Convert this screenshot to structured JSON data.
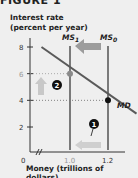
{
  "figure_title": "FIGURE 1",
  "chart_data": {
    "type": "line",
    "title": "FIGURE 1",
    "ylabel_line1": "Interest rate",
    "ylabel_line2": "(percent per year)",
    "xlabel": "Money (trillions of dollars)",
    "y_ticks": [
      2,
      4,
      6,
      8
    ],
    "y_tick_labels": [
      "2",
      "4",
      "6",
      "8"
    ],
    "x_ticks": [
      1.0,
      1.2
    ],
    "x_tick_labels": [
      "1.0",
      "1.2"
    ],
    "origin_label": "0",
    "xlim": [
      0.8,
      1.35
    ],
    "ylim": [
      0,
      9
    ],
    "series": [
      {
        "name": "MD",
        "label": "MD",
        "type": "demand",
        "points": [
          [
            0.85,
            8
          ],
          [
            1.35,
            3
          ]
        ]
      },
      {
        "name": "MS1",
        "label": "MS",
        "sub": "1",
        "type": "vertical",
        "x": 1.0
      },
      {
        "name": "MS0",
        "label": "MS",
        "sub": "0",
        "type": "vertical",
        "x": 1.2
      }
    ],
    "equilibria": [
      {
        "x": 1.2,
        "y": 4,
        "color": "#111111"
      },
      {
        "x": 1.0,
        "y": 6,
        "color": "#8a8a8a"
      }
    ],
    "annotations": [
      {
        "label": "1",
        "text": "Money supply decreases from MS0 to MS1"
      },
      {
        "label": "2",
        "text": "Interest rate rises from 4 to 6"
      }
    ],
    "colors": {
      "ms": "#7a7a7a",
      "md": "#5a5a5a",
      "arrow": "#9c9c9c",
      "up_arrow": "#c8c8c8",
      "axis": "#333333",
      "marker": "#111111"
    }
  }
}
